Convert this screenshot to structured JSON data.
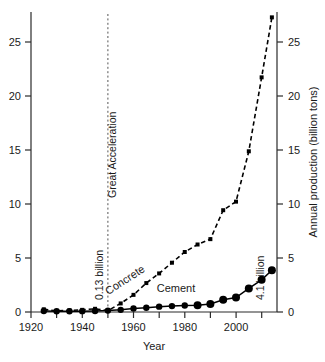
{
  "chart_data": {
    "type": "line",
    "title": "",
    "xlabel": "Year",
    "ylabel_left": "",
    "ylabel_right": "Annual production (billion tons)",
    "xlim": [
      1920,
      2016
    ],
    "ylim": [
      0,
      28
    ],
    "xticks": [
      1920,
      1930,
      1940,
      1950,
      1960,
      1970,
      1980,
      1990,
      2000,
      2010
    ],
    "xtick_labels": [
      "1920",
      "",
      "1940",
      "",
      "1960",
      "",
      "1980",
      "",
      "2000",
      ""
    ],
    "yticks": [
      0,
      5,
      10,
      15,
      20,
      25
    ],
    "ytick_labels": [
      "0",
      "5",
      "10",
      "15",
      "20",
      "25"
    ],
    "grid": false,
    "legend": "inline-labels",
    "series": [
      {
        "name": "Concrete",
        "style": "dashed",
        "marker": "square",
        "x": [
          1925,
          1930,
          1935,
          1940,
          1945,
          1950,
          1955,
          1960,
          1965,
          1970,
          1975,
          1980,
          1985,
          1990,
          1995,
          2000,
          2005,
          2010,
          2014
        ],
        "values": [
          0.25,
          0.1,
          0.15,
          0.2,
          0.3,
          0.13,
          0.8,
          1.6,
          2.7,
          3.6,
          4.6,
          5.6,
          6.3,
          6.8,
          9.5,
          10.3,
          15.0,
          21.9,
          27.5
        ]
      },
      {
        "name": "Cement",
        "style": "solid",
        "marker": "circle",
        "x": [
          1925,
          1930,
          1935,
          1940,
          1945,
          1950,
          1955,
          1960,
          1965,
          1970,
          1975,
          1980,
          1985,
          1990,
          1995,
          2000,
          2005,
          2010,
          2014
        ],
        "values": [
          0.1,
          0.07,
          0.07,
          0.08,
          0.1,
          0.13,
          0.2,
          0.32,
          0.4,
          0.5,
          0.55,
          0.6,
          0.62,
          0.75,
          1.15,
          1.35,
          2.2,
          3.0,
          3.9
        ]
      }
    ],
    "annotations": [
      {
        "name": "great-acceleration",
        "text": "Great Acceleration",
        "x": 1950,
        "rotation": -90
      },
      {
        "name": "start-value",
        "text": "0.13 billion",
        "x": 1950,
        "y": 0.13,
        "rotation": -90
      },
      {
        "name": "end-value",
        "text": "4.1 billion",
        "x": 2014,
        "y": 3.9,
        "rotation": -90
      }
    ],
    "vertical_line": {
      "name": "great-acceleration-line",
      "x": 1950,
      "style": "dashed"
    },
    "series_labels": [
      {
        "name": "concrete-label",
        "text": "Concrete",
        "rotation": -33
      },
      {
        "name": "cement-label",
        "text": "Cement",
        "rotation": 0
      }
    ]
  },
  "colors": {
    "axis": "#2b2b2b",
    "series": "#000000",
    "vline": "#555555",
    "background": "#ffffff"
  }
}
